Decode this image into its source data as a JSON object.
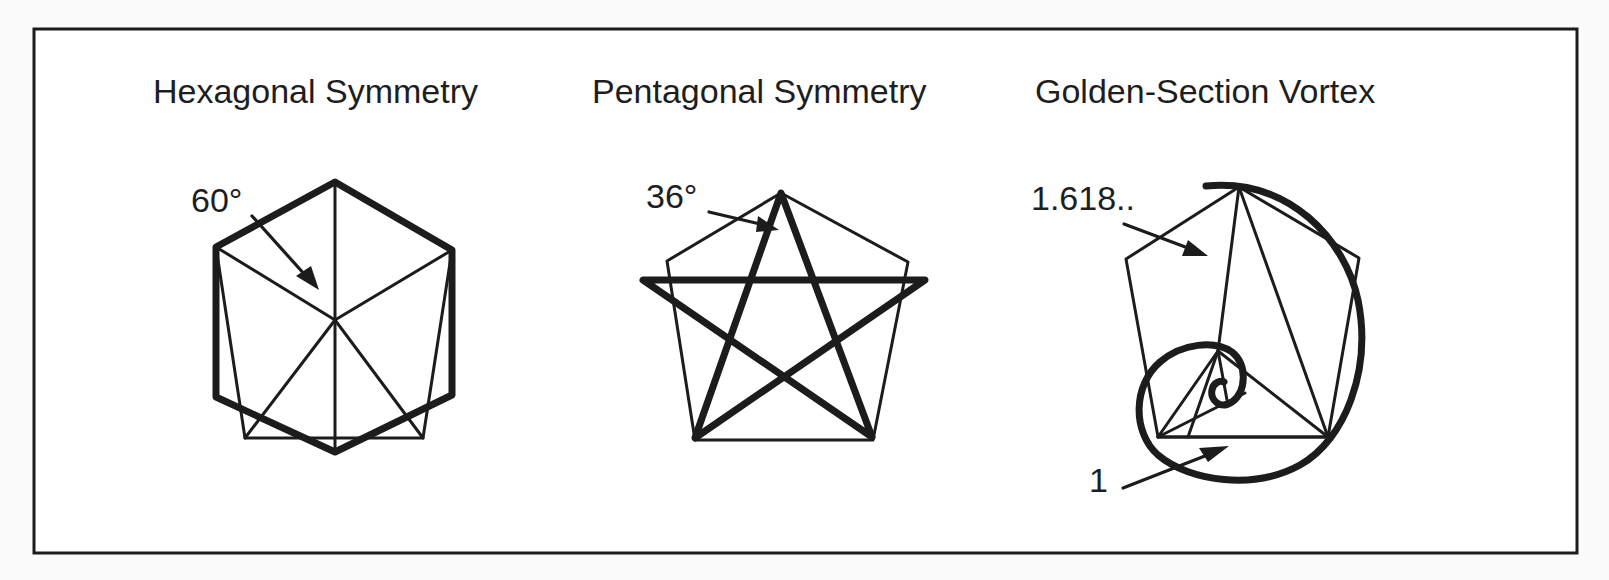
{
  "figure": {
    "frame": {
      "x": 34,
      "y": 29,
      "width": 1543,
      "height": 524,
      "stroke": "#1c1c1c",
      "background": "#ffffff"
    },
    "panels": [
      {
        "id": "hexagonal",
        "title": "Hexagonal Symmetry",
        "angle_label": "60°",
        "description": "Regular hexagon (bold) with center spokes and an inscribed irregular pentagon; arrow indicates 60° angle at center"
      },
      {
        "id": "pentagonal",
        "title": "Pentagonal Symmetry",
        "angle_label": "36°",
        "description": "Regular pentagon (thin) with bold pentagram star; arrow indicates 36° angle at top point"
      },
      {
        "id": "golden",
        "title": "Golden-Section Vortex",
        "ratio_label_long": "1.618..",
        "ratio_label_short": "1",
        "description": "Pentagon with nested golden triangles and a bold logarithmic (golden) spiral vortex"
      }
    ],
    "colors": {
      "ink": "#1c1c1c",
      "text": "#1e1e1e",
      "page": "#fbfbfb",
      "panel": "#ffffff"
    }
  }
}
